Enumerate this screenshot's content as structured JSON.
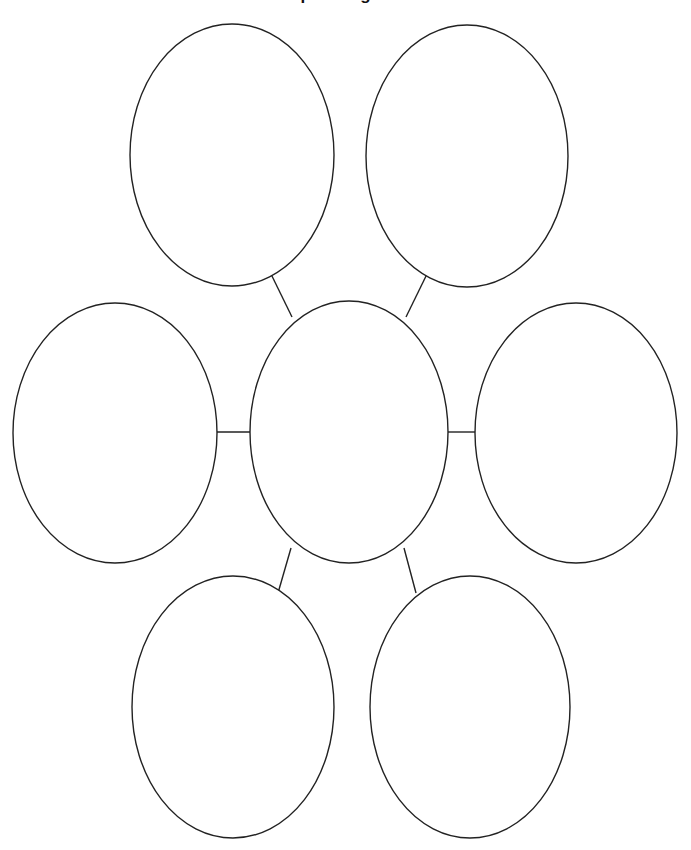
{
  "page": {
    "title": "Graphic Organizer",
    "background_color": "#ffffff",
    "width": 691,
    "height": 850
  },
  "style": {
    "stroke_color": "#222222",
    "stroke_width": 1.4,
    "fill_color": "#ffffff"
  },
  "diagram": {
    "type": "concept-map",
    "oval_count": 7,
    "connector_count": 6,
    "ovals": [
      {
        "id": "center",
        "label": "",
        "cx": 349,
        "cy": 432,
        "rx": 99,
        "ry": 131
      },
      {
        "id": "top-left",
        "label": "",
        "cx": 232,
        "cy": 155,
        "rx": 102,
        "ry": 131
      },
      {
        "id": "top-right",
        "label": "",
        "cx": 467,
        "cy": 156,
        "rx": 101,
        "ry": 131
      },
      {
        "id": "middle-left",
        "label": "",
        "cx": 115,
        "cy": 433,
        "rx": 102,
        "ry": 130
      },
      {
        "id": "middle-right",
        "label": "",
        "cx": 576,
        "cy": 433,
        "rx": 101,
        "ry": 130
      },
      {
        "id": "bottom-left",
        "label": "",
        "cx": 233,
        "cy": 707,
        "rx": 101,
        "ry": 131
      },
      {
        "id": "bottom-right",
        "label": "",
        "cx": 470,
        "cy": 707,
        "rx": 100,
        "ry": 131
      }
    ],
    "connectors": [
      {
        "id": "center-to-top-left",
        "from": "center",
        "to": "top-left",
        "x1": 292,
        "y1": 317,
        "x2": 270,
        "y2": 272
      },
      {
        "id": "center-to-top-right",
        "from": "center",
        "to": "top-right",
        "x1": 406,
        "y1": 317,
        "x2": 428,
        "y2": 272
      },
      {
        "id": "center-to-middle-left",
        "from": "center",
        "to": "middle-left",
        "x1": 250,
        "y1": 432,
        "x2": 217,
        "y2": 432
      },
      {
        "id": "center-to-middle-right",
        "from": "center",
        "to": "middle-right",
        "x1": 448,
        "y1": 432,
        "x2": 477,
        "y2": 432
      },
      {
        "id": "center-to-bottom-left",
        "from": "center",
        "to": "bottom-left",
        "x1": 291,
        "y1": 548,
        "x2": 278,
        "y2": 593
      },
      {
        "id": "center-to-bottom-right",
        "from": "center",
        "to": "bottom-right",
        "x1": 404,
        "y1": 548,
        "x2": 416,
        "y2": 593
      }
    ]
  }
}
